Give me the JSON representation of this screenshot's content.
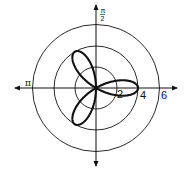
{
  "chart_data": {
    "type": "polar-line",
    "title": "",
    "equation": "r = 4cos(3θ)",
    "series": [
      {
        "name": "rose curve",
        "petals": 3,
        "amplitude": 4,
        "petal_angles_deg": [
          0,
          120,
          240
        ],
        "color": "#111111"
      }
    ],
    "radial_ticks": [
      2,
      4,
      6
    ],
    "radial_tick_labels": [
      "2",
      "4",
      "6"
    ],
    "angle_labels": [
      {
        "angle": "π/2",
        "numerator": "π",
        "denominator": "2",
        "position": "top"
      },
      {
        "angle": "π",
        "label": "π",
        "position": "left"
      }
    ],
    "rlim": [
      0,
      6
    ],
    "grid": "concentric circles at r = 2, 4, 6",
    "axes_color": "#111111"
  },
  "labels": {
    "tick_2": "2",
    "tick_4": "4",
    "tick_6": "6",
    "pi_left": "π",
    "half_pi_num": "π",
    "half_pi_den": "2"
  }
}
